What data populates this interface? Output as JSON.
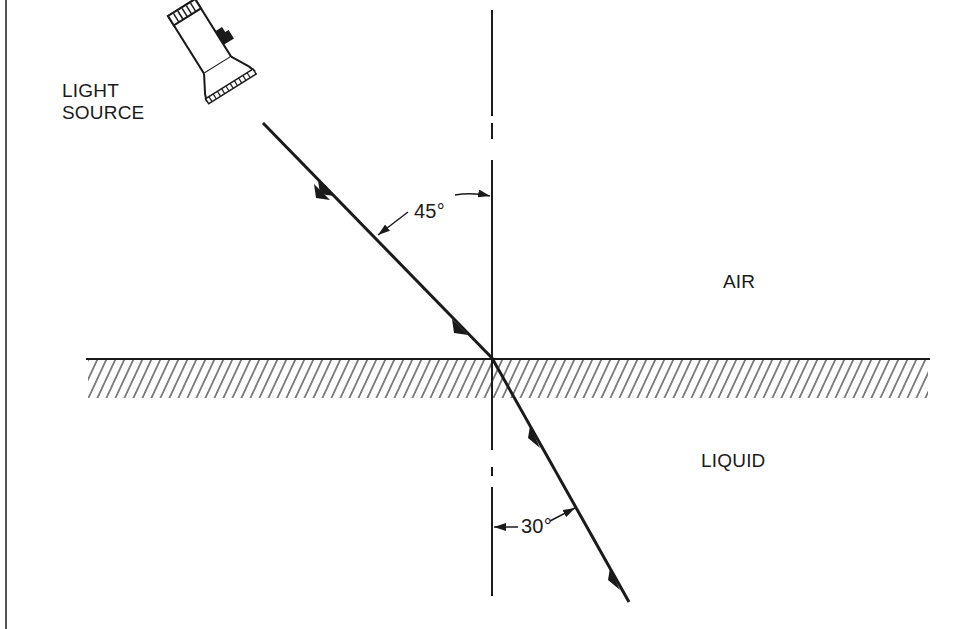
{
  "diagram": {
    "type": "refraction-of-light",
    "labels": {
      "light_source_line1": "LIGHT",
      "light_source_line2": "SOURCE",
      "air": "AIR",
      "liquid": "LIQUID",
      "incidence_angle": "45°",
      "refraction_angle": "30°"
    },
    "angles": {
      "incidence_deg": 45,
      "refraction_deg": 30
    },
    "media": {
      "upper": "AIR",
      "lower": "LIQUID"
    },
    "colors": {
      "ink": "#1a1a1a",
      "background": "#ffffff"
    }
  }
}
